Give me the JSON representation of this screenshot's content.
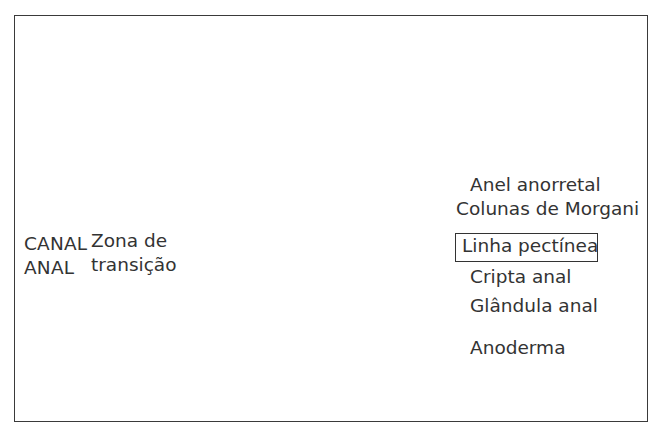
{
  "figure": {
    "kind": "anatomical-illustration",
    "language": "pt-BR",
    "border_color": "#3a3a3a",
    "background_color": "#ffffff",
    "leader_line_color": "#1a1a1a",
    "text_color": "#333333"
  },
  "labels": {
    "right": [
      {
        "id": "anel-anorretal",
        "text": "Anel anorretal",
        "boxed": false
      },
      {
        "id": "colunas-de-morgani",
        "text": "Colunas de Morgani",
        "boxed": false
      },
      {
        "id": "linha-pectinea",
        "text": "Linha pectínea",
        "boxed": true
      },
      {
        "id": "cripta-anal",
        "text": "Cripta anal",
        "boxed": false
      },
      {
        "id": "glandula-anal",
        "text": "Glândula anal",
        "boxed": false
      },
      {
        "id": "anoderma",
        "text": "Anoderma",
        "boxed": false
      }
    ],
    "left": {
      "canal_line1": "CANAL",
      "canal_line2": "ANAL",
      "zona_line1": "Zona de",
      "zona_line2": "transição"
    }
  },
  "illustration": {
    "palette": {
      "lumen_light": "#c9c9c9",
      "wall_mid": "#a9a9a9",
      "muscle_dark": "#6f6f6f",
      "muscle_darker": "#565656",
      "mucosa_pale": "#e2e2e2",
      "outline": "#2f2f2f",
      "stipple": "#b4b4b4",
      "highlight": "#f2f2f2"
    },
    "structures": [
      "reto / ampola retal",
      "músculo elevador do ânus",
      "esfíncter anal interno",
      "esfíncter anal externo",
      "plexo hemorroidário",
      "linha pectínea serrilhada",
      "anoderma"
    ]
  }
}
